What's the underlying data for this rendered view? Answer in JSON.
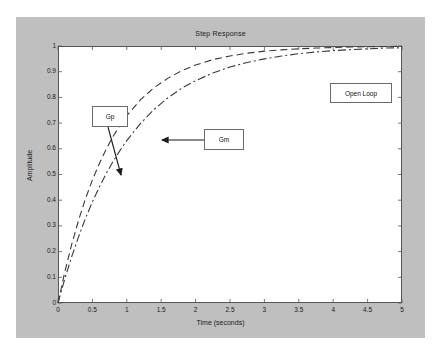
{
  "figure": {
    "background_color": "#bfbfbf",
    "plot_background_color": "#ffffff",
    "axis_color": "#555555"
  },
  "chart_data": {
    "type": "line",
    "title": "Step Response",
    "xlabel": "Time (seconds)",
    "ylabel": "Amplitude",
    "xlim": [
      0,
      5
    ],
    "ylim": [
      0,
      1
    ],
    "grid": false,
    "legend_position": "none",
    "xticks": [
      "0",
      "0.5",
      "1",
      "1.5",
      "2",
      "2.5",
      "3",
      "3.5",
      "4",
      "4.5",
      "5"
    ],
    "xtick_values": [
      0,
      0.5,
      1,
      1.5,
      2,
      2.5,
      3,
      3.5,
      4,
      4.5,
      5
    ],
    "yticks": [
      "0",
      "0.1",
      "0.2",
      "0.3",
      "0.4",
      "0.5",
      "0.6",
      "0.7",
      "0.8",
      "0.9",
      "1"
    ],
    "ytick_values": [
      0,
      0.1,
      0.2,
      0.3,
      0.4,
      0.5,
      0.6,
      0.7,
      0.8,
      0.9,
      1
    ],
    "x": [
      0,
      0.1,
      0.2,
      0.3,
      0.4,
      0.5,
      0.6,
      0.7,
      0.8,
      0.9,
      1.0,
      1.2,
      1.4,
      1.6,
      1.8,
      2.0,
      2.25,
      2.5,
      2.75,
      3.0,
      3.25,
      3.5,
      3.75,
      4.0,
      4.25,
      4.5,
      4.75,
      5.0
    ],
    "series": [
      {
        "name": "Gp",
        "style": "dashed",
        "color": "#3a3a3a",
        "values": [
          0,
          0.122,
          0.229,
          0.323,
          0.406,
          0.479,
          0.542,
          0.598,
          0.648,
          0.691,
          0.729,
          0.791,
          0.839,
          0.875,
          0.904,
          0.926,
          0.947,
          0.961,
          0.972,
          0.98,
          0.985,
          0.989,
          0.992,
          0.994,
          0.996,
          0.997,
          0.998,
          0.999
        ]
      },
      {
        "name": "Gm",
        "style": "dashdot",
        "color": "#3a3a3a",
        "values": [
          0,
          0.095,
          0.181,
          0.259,
          0.33,
          0.393,
          0.451,
          0.503,
          0.551,
          0.593,
          0.632,
          0.699,
          0.754,
          0.799,
          0.836,
          0.865,
          0.895,
          0.918,
          0.936,
          0.95,
          0.961,
          0.97,
          0.977,
          0.982,
          0.986,
          0.989,
          0.992,
          0.993
        ]
      }
    ],
    "annotations": [
      {
        "label": "Gp",
        "box": {
          "x": 76,
          "y": 89,
          "w": 36,
          "h": 21
        },
        "arrow_from": {
          "x": 92,
          "y": 110
        },
        "arrow_to": {
          "x": 105,
          "y": 158
        }
      },
      {
        "label": "Gm",
        "box": {
          "x": 188,
          "y": 112,
          "w": 40,
          "h": 21
        },
        "arrow_from": {
          "x": 188,
          "y": 123
        },
        "arrow_to": {
          "x": 146,
          "y": 123
        }
      },
      {
        "label": "Open Loop",
        "box": {
          "x": 314,
          "y": 66,
          "w": 62,
          "h": 20
        },
        "arrow_from": null,
        "arrow_to": null
      }
    ]
  }
}
